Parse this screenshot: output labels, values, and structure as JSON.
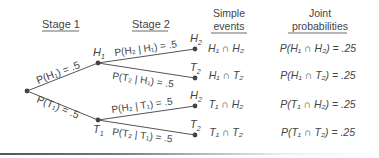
{
  "headers": {
    "stage1": "Stage 1",
    "stage2": "Stage 2",
    "simple_line1": "Simple",
    "simple_line2": "events",
    "joint_line1": "Joint",
    "joint_line2": "probabilities"
  },
  "nodes": {
    "H1": "H",
    "T1": "T",
    "H2a": "H",
    "T2a": "T",
    "H2b": "H",
    "T2b": "T"
  },
  "stage1_branches": [
    {
      "label": "P(H₁) = .5"
    },
    {
      "label": "P(T₁) = .5"
    }
  ],
  "stage2_branches": [
    {
      "label": "P(H₂ | H₁) = .5"
    },
    {
      "label": "P(T₂ | H₁) = .5"
    },
    {
      "label": "P(H₂ | T₁) = .5"
    },
    {
      "label": "P(T₂ | T₁) = .5"
    }
  ],
  "outcomes": [
    {
      "event": "H₁ ∩ H₂",
      "joint": "P(H₁ ∩ H₂) = .25"
    },
    {
      "event": "H₁ ∩ T₂",
      "joint": "P(H₁ ∩ T₂) = .25"
    },
    {
      "event": "T₁ ∩ H₂",
      "joint": "P(T₁ ∩ H₂) = .25"
    },
    {
      "event": "T₁ ∩ T₂",
      "joint": "P(T₁ ∩ T₂) = .25"
    }
  ]
}
